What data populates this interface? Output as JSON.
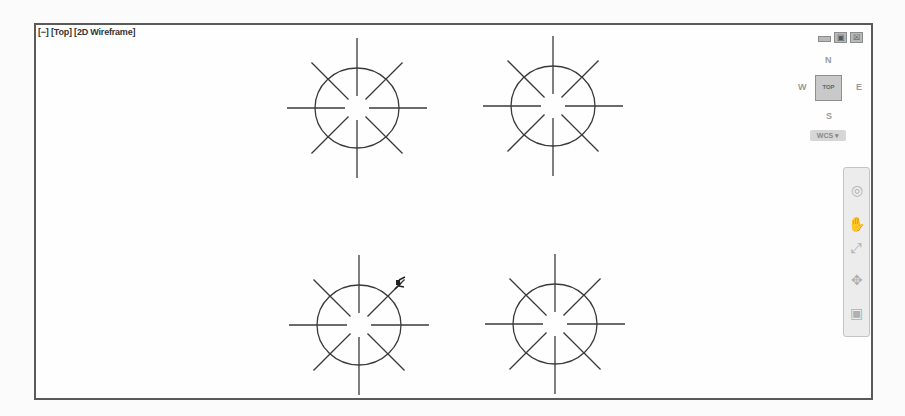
{
  "viewport": {
    "label_parts": [
      "[−]",
      "[Top]",
      "[2D Wireframe]"
    ],
    "window_controls": {
      "minimize": "‒",
      "restore": "▣",
      "close": "☒"
    }
  },
  "viewcube": {
    "north": "N",
    "south": "S",
    "east": "E",
    "west": "W",
    "face": "TOP",
    "ucs_button": "WCS ▾"
  },
  "navigation_bar": {
    "items": [
      {
        "name": "steering-wheel",
        "glyph": "◎"
      },
      {
        "name": "pan",
        "glyph": "✋"
      },
      {
        "name": "zoom-extents",
        "glyph": "⤢"
      },
      {
        "name": "orbit",
        "glyph": "✥"
      },
      {
        "name": "showmotion",
        "glyph": "▣"
      }
    ]
  },
  "drawing": {
    "stroke_color": "#3a3a3a",
    "symbols": [
      {
        "cx": 321,
        "cy": 83,
        "r": 41,
        "arm": 70,
        "gap": 12
      },
      {
        "cx": 517,
        "cy": 81,
        "r": 41,
        "arm": 70,
        "gap": 12
      },
      {
        "cx": 323,
        "cy": 300,
        "r": 41,
        "arm": 70,
        "gap": 12
      },
      {
        "cx": 519,
        "cy": 299,
        "r": 41,
        "arm": 70,
        "gap": 12
      }
    ],
    "cursor": {
      "x": 363,
      "y": 258
    }
  }
}
